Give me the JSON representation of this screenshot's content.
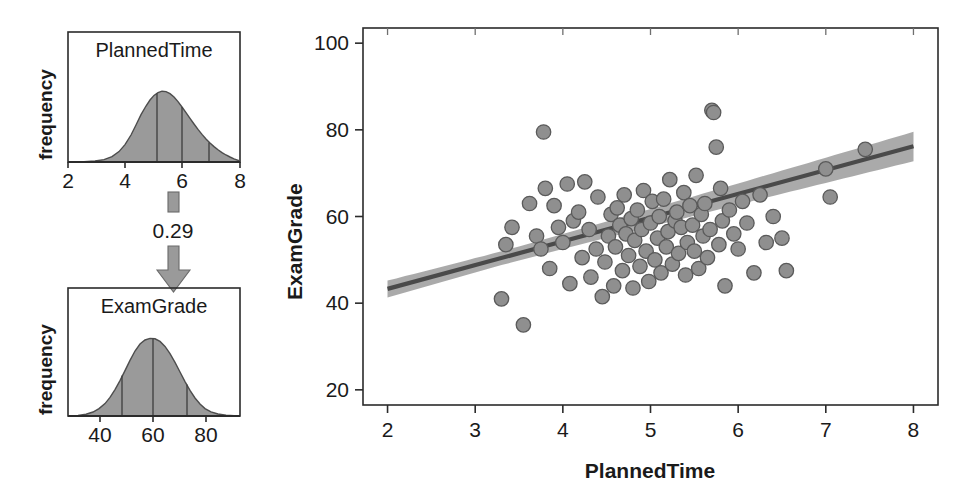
{
  "figure": {
    "name": "path-diagram-with-scatterplot",
    "background": "#ffffff",
    "point_color": "#8f8f8f",
    "point_edge_color": "#5a5a5a",
    "band_color": "#a3a3a3",
    "line_color": "#4a4a4a",
    "density_fill": "#9a9a9a"
  },
  "left_panel": {
    "top_density": {
      "title": "PlannedTime",
      "y_axis_label": "frequency",
      "x_ticks": [
        "2",
        "4",
        "6",
        "8"
      ],
      "x_tick_values": [
        2,
        4,
        6,
        8
      ],
      "quartile_values": [
        4.3,
        5.2,
        6.3
      ],
      "shape": "right-skewed"
    },
    "bottom_density": {
      "title": "ExamGrade",
      "y_axis_label": "frequency",
      "x_ticks": [
        "40",
        "60",
        "80"
      ],
      "x_tick_values": [
        40,
        60,
        80
      ],
      "quartile_values": [
        51,
        60,
        70
      ],
      "shape": "symmetric-normal"
    },
    "path_arrow": {
      "label": "0.29",
      "direction": "down",
      "from": "PlannedTime",
      "to": "ExamGrade"
    }
  },
  "chart_data": {
    "type": "scatter",
    "title": "",
    "xlabel": "PlannedTime",
    "ylabel": "ExamGrade",
    "xlim": [
      1.72,
      8.28
    ],
    "ylim": [
      16.5,
      103.5
    ],
    "xticks": [
      2,
      3,
      4,
      5,
      6,
      7,
      8
    ],
    "xticklabels": [
      "2",
      "3",
      "4",
      "5",
      "6",
      "7",
      "8"
    ],
    "yticks": [
      20,
      40,
      60,
      80,
      100
    ],
    "yticklabels": [
      "20",
      "40",
      "60",
      "80",
      "100"
    ],
    "grid": false,
    "legend": null,
    "regression": {
      "type": "linear-fit-with-confidence-band",
      "x_start": 2.0,
      "y_start": 43.3,
      "x_end": 8.0,
      "y_end": 76.2,
      "slope": 5.48,
      "intercept": 32.3,
      "band_halfwidth_start": 3.6,
      "band_halfwidth_mid": 1.6,
      "band_halfwidth_end": 3.4,
      "band_min_x": 3.3
    },
    "x": [
      3.3,
      3.35,
      3.42,
      3.55,
      3.62,
      3.7,
      3.75,
      3.78,
      3.8,
      3.85,
      3.9,
      3.95,
      4.0,
      4.05,
      4.08,
      4.12,
      4.18,
      4.22,
      4.25,
      4.3,
      4.32,
      4.38,
      4.4,
      4.45,
      4.48,
      4.52,
      4.55,
      4.58,
      4.6,
      4.62,
      4.65,
      4.68,
      4.7,
      4.72,
      4.75,
      4.78,
      4.8,
      4.82,
      4.85,
      4.88,
      4.9,
      4.92,
      4.95,
      4.98,
      5.0,
      5.02,
      5.05,
      5.08,
      5.1,
      5.12,
      5.15,
      5.18,
      5.2,
      5.22,
      5.25,
      5.28,
      5.3,
      5.32,
      5.35,
      5.38,
      5.4,
      5.42,
      5.45,
      5.48,
      5.5,
      5.52,
      5.55,
      5.58,
      5.6,
      5.62,
      5.65,
      5.68,
      5.7,
      5.72,
      5.75,
      5.78,
      5.8,
      5.82,
      5.85,
      5.9,
      5.95,
      6.0,
      6.05,
      6.1,
      6.18,
      6.25,
      6.32,
      6.4,
      6.5,
      6.55,
      7.0,
      7.05,
      7.45
    ],
    "y": [
      41.0,
      53.5,
      57.5,
      35.0,
      63.0,
      55.5,
      52.5,
      79.5,
      66.5,
      48.0,
      62.5,
      57.5,
      54.0,
      67.5,
      44.5,
      59.0,
      61.0,
      50.5,
      68.0,
      57.0,
      46.0,
      52.5,
      64.5,
      41.5,
      49.5,
      55.5,
      60.5,
      44.0,
      53.0,
      62.0,
      58.0,
      47.5,
      65.0,
      56.0,
      51.0,
      59.5,
      43.5,
      54.5,
      61.5,
      48.5,
      57.0,
      66.0,
      52.0,
      45.0,
      58.5,
      63.5,
      50.0,
      55.0,
      60.0,
      47.0,
      64.0,
      53.0,
      56.5,
      68.5,
      49.0,
      59.0,
      61.0,
      51.5,
      57.5,
      65.5,
      46.5,
      54.0,
      62.5,
      58.0,
      52.0,
      69.5,
      48.0,
      60.5,
      55.5,
      63.0,
      50.5,
      57.0,
      84.5,
      84.0,
      76.0,
      53.5,
      66.5,
      59.0,
      44.0,
      61.5,
      56.0,
      52.5,
      63.5,
      58.5,
      47.0,
      65.0,
      54.0,
      60.0,
      55.0,
      47.5,
      71.0,
      64.5,
      75.5
    ]
  }
}
